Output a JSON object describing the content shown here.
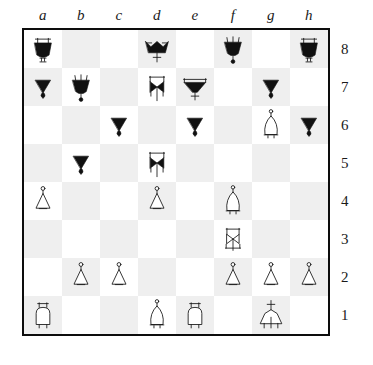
{
  "diagram": {
    "type": "chess-board-diagram",
    "orientation": "white-bottom",
    "files": [
      "a",
      "b",
      "c",
      "d",
      "e",
      "f",
      "g",
      "h"
    ],
    "ranks": [
      "8",
      "7",
      "6",
      "5",
      "4",
      "3",
      "2",
      "1"
    ],
    "colors": {
      "light_square": "#ffffff",
      "dark_square": "#efefef",
      "black_piece": "#111111",
      "white_piece": "#ffffff",
      "border": "#0d0d0d",
      "label": "#1a1a1a"
    },
    "position": [
      [
        {
          "square": "a8",
          "piece": "black-rook"
        },
        {
          "square": "b8",
          "piece": ""
        },
        {
          "square": "c8",
          "piece": ""
        },
        {
          "square": "d8",
          "piece": "black-king"
        },
        {
          "square": "e8",
          "piece": ""
        },
        {
          "square": "f8",
          "piece": "black-queen"
        },
        {
          "square": "g8",
          "piece": ""
        },
        {
          "square": "h8",
          "piece": "black-rook"
        }
      ],
      [
        {
          "square": "a7",
          "piece": "black-pawn"
        },
        {
          "square": "b7",
          "piece": "black-queen"
        },
        {
          "square": "c7",
          "piece": ""
        },
        {
          "square": "d7",
          "piece": "black-knight"
        },
        {
          "square": "e7",
          "piece": "black-bishop"
        },
        {
          "square": "f7",
          "piece": ""
        },
        {
          "square": "g7",
          "piece": "black-pawn"
        },
        {
          "square": "h7",
          "piece": ""
        }
      ],
      [
        {
          "square": "a6",
          "piece": ""
        },
        {
          "square": "b6",
          "piece": ""
        },
        {
          "square": "c6",
          "piece": "black-pawn"
        },
        {
          "square": "d6",
          "piece": ""
        },
        {
          "square": "e6",
          "piece": "black-pawn"
        },
        {
          "square": "f6",
          "piece": ""
        },
        {
          "square": "g6",
          "piece": "white-bishop"
        },
        {
          "square": "h6",
          "piece": "black-pawn"
        }
      ],
      [
        {
          "square": "a5",
          "piece": ""
        },
        {
          "square": "b5",
          "piece": "black-pawn"
        },
        {
          "square": "c5",
          "piece": ""
        },
        {
          "square": "d5",
          "piece": "black-knight"
        },
        {
          "square": "e5",
          "piece": ""
        },
        {
          "square": "f5",
          "piece": ""
        },
        {
          "square": "g5",
          "piece": ""
        },
        {
          "square": "h5",
          "piece": ""
        }
      ],
      [
        {
          "square": "a4",
          "piece": "white-pawn"
        },
        {
          "square": "b4",
          "piece": ""
        },
        {
          "square": "c4",
          "piece": ""
        },
        {
          "square": "d4",
          "piece": "white-pawn"
        },
        {
          "square": "e4",
          "piece": ""
        },
        {
          "square": "f4",
          "piece": "white-bishop"
        },
        {
          "square": "g4",
          "piece": ""
        },
        {
          "square": "h4",
          "piece": ""
        }
      ],
      [
        {
          "square": "a3",
          "piece": ""
        },
        {
          "square": "b3",
          "piece": ""
        },
        {
          "square": "c3",
          "piece": ""
        },
        {
          "square": "d3",
          "piece": ""
        },
        {
          "square": "e3",
          "piece": ""
        },
        {
          "square": "f3",
          "piece": "white-knight"
        },
        {
          "square": "g3",
          "piece": ""
        },
        {
          "square": "h3",
          "piece": ""
        }
      ],
      [
        {
          "square": "a2",
          "piece": ""
        },
        {
          "square": "b2",
          "piece": "white-pawn"
        },
        {
          "square": "c2",
          "piece": "white-pawn"
        },
        {
          "square": "d2",
          "piece": ""
        },
        {
          "square": "e2",
          "piece": ""
        },
        {
          "square": "f2",
          "piece": "white-pawn"
        },
        {
          "square": "g2",
          "piece": "white-pawn"
        },
        {
          "square": "h2",
          "piece": "white-pawn"
        }
      ],
      [
        {
          "square": "a1",
          "piece": "white-rook"
        },
        {
          "square": "b1",
          "piece": ""
        },
        {
          "square": "c1",
          "piece": ""
        },
        {
          "square": "d1",
          "piece": "white-bishop"
        },
        {
          "square": "e1",
          "piece": "white-rook"
        },
        {
          "square": "f1",
          "piece": ""
        },
        {
          "square": "g1",
          "piece": "white-king"
        },
        {
          "square": "h1",
          "piece": ""
        }
      ]
    ]
  }
}
